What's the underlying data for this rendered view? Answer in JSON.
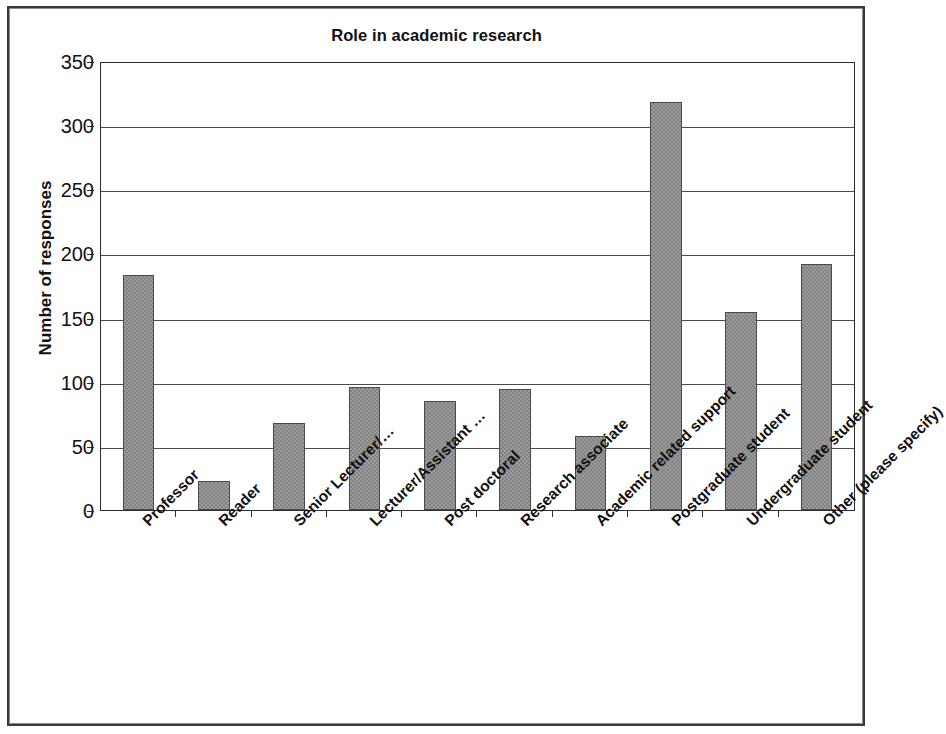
{
  "chart_data": {
    "type": "bar",
    "title": "Role in academic research",
    "xlabel": "",
    "ylabel": "Number of responses",
    "ylim": [
      0,
      350
    ],
    "ytick_step": 50,
    "yticks": [
      350,
      300,
      250,
      200,
      150,
      100,
      50,
      0
    ],
    "grid": true,
    "legend": false,
    "bar_color": "#9a9a9a",
    "bar_border_color": "#4a4a4a",
    "axis_color": "#2e2e2e",
    "categories": [
      "Professor",
      "Reader",
      "Senior Lecturer/…",
      "Lecturer/Assistant …",
      "Post doctoral",
      "Research associate",
      "Academic related support",
      "Postgraduate student",
      "Undergraduate student",
      "Other (please specify)"
    ],
    "values": [
      183,
      23,
      68,
      96,
      85,
      94,
      58,
      318,
      154,
      192
    ]
  }
}
